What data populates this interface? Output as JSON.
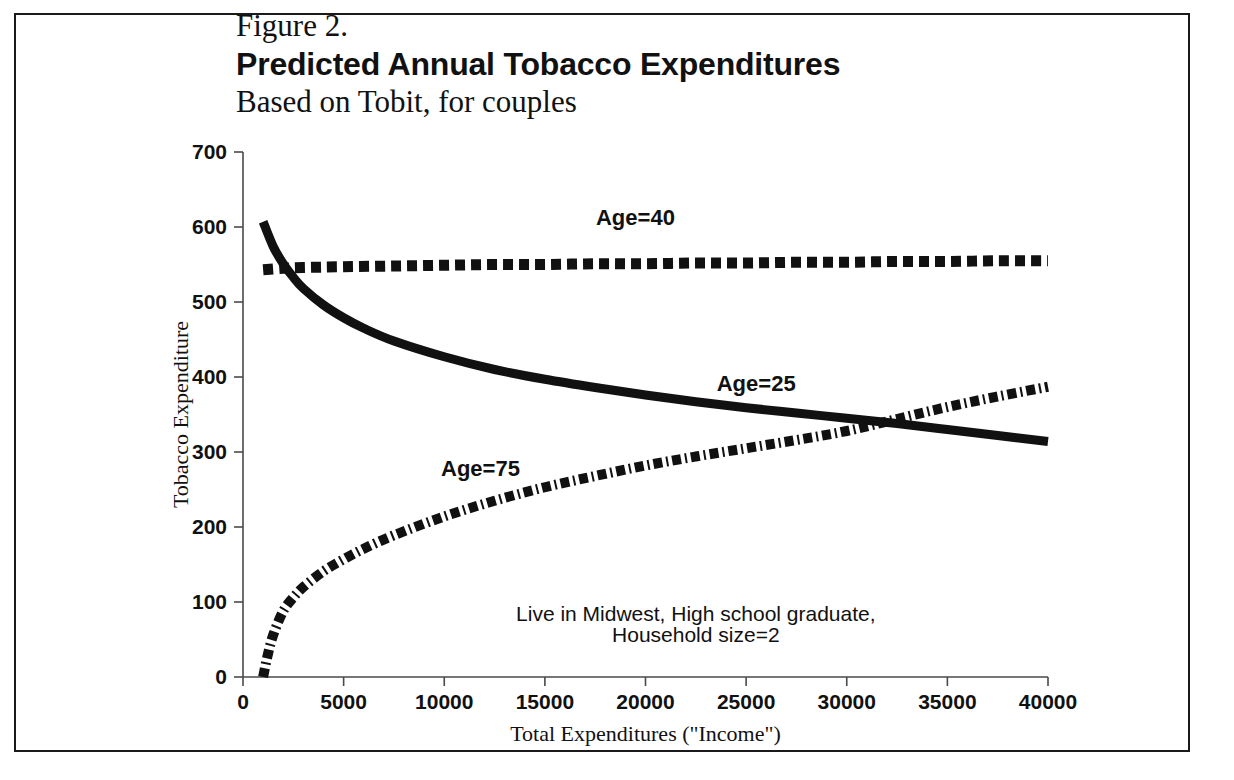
{
  "figure": {
    "title_line1": "Figure 2.",
    "title_line2": "Predicted Annual Tobacco Expenditures",
    "title_line3": "Based on Tobit, for couples"
  },
  "annotation": {
    "line1": "Live in Midwest, High school graduate,",
    "line2": "Household size=2"
  },
  "chart_data": {
    "type": "line",
    "title": "Predicted Annual Tobacco Expenditures",
    "subtitle": "Based on Tobit, for couples",
    "xlabel": "Total Expenditures (\"Income\")",
    "ylabel": "Tobacco Expenditure",
    "xlim": [
      0,
      40000
    ],
    "ylim": [
      0,
      700
    ],
    "xticks": [
      0,
      5000,
      10000,
      15000,
      20000,
      25000,
      30000,
      35000,
      40000
    ],
    "xtick_labels": [
      "0",
      "5000",
      "10000",
      "15000",
      "20000",
      "25000",
      "30000",
      "35000",
      "40000"
    ],
    "yticks": [
      0,
      100,
      200,
      300,
      400,
      500,
      600,
      700
    ],
    "ytick_labels": [
      "0",
      "100",
      "200",
      "300",
      "400",
      "500",
      "600",
      "700"
    ],
    "grid": false,
    "legend": "inline-labels",
    "annotations": [
      {
        "text": "Age=40",
        "x": 19500,
        "y": 603
      },
      {
        "text": "Age=25",
        "x": 25500,
        "y": 382
      },
      {
        "text": "Age=75",
        "x": 11800,
        "y": 268
      },
      {
        "text": "Live in Midwest, High school graduate,",
        "x": 22500,
        "y": 75
      },
      {
        "text": "Household size=2",
        "x": 22500,
        "y": 47
      }
    ],
    "series": [
      {
        "name": "Age=40",
        "style": "dotted",
        "x": [
          1000,
          2000,
          3000,
          5000,
          7500,
          10000,
          12500,
          15000,
          17500,
          20000,
          22500,
          25000,
          27500,
          30000,
          32500,
          35000,
          37500,
          40000
        ],
        "values": [
          543,
          545,
          546,
          547,
          548,
          549,
          550,
          550,
          551,
          551,
          552,
          552,
          553,
          553,
          554,
          554,
          555,
          555
        ]
      },
      {
        "name": "Age=25",
        "style": "solid",
        "x": [
          1000,
          1500,
          2000,
          2500,
          3000,
          4000,
          5000,
          6000,
          7500,
          10000,
          12500,
          15000,
          17500,
          20000,
          22500,
          25000,
          27500,
          30000,
          32500,
          35000,
          37500,
          40000
        ],
        "values": [
          607,
          574,
          551,
          533,
          518,
          496,
          479,
          465,
          448,
          427,
          410,
          397,
          386,
          376,
          367,
          359,
          352,
          345,
          338,
          330,
          322,
          314
        ]
      },
      {
        "name": "Age=75",
        "style": "dashdot",
        "x": [
          1000,
          1200,
          1500,
          2000,
          2500,
          3000,
          4000,
          5000,
          6000,
          7500,
          10000,
          12500,
          15000,
          17500,
          20000,
          22500,
          25000,
          27500,
          30000,
          32500,
          35000,
          37500,
          40000
        ],
        "values": [
          0,
          26,
          56,
          88,
          106,
          120,
          141,
          157,
          171,
          189,
          214,
          235,
          253,
          268,
          282,
          294,
          305,
          316,
          328,
          344,
          360,
          374,
          387
        ]
      }
    ]
  }
}
